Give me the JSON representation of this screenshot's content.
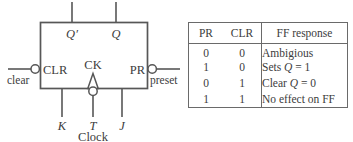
{
  "figure": {
    "block": {
      "inputs_top": [
        {
          "name": "q-not-output",
          "label": "Q′",
          "italic": true
        },
        {
          "name": "q-output",
          "label": "Q",
          "italic": true
        }
      ],
      "left_port": {
        "label": "CLR",
        "wire_label": "clear",
        "bubble": true
      },
      "right_port": {
        "label": "PR",
        "wire_label": "preset",
        "bubble": true
      },
      "clock_port": {
        "label": "CK",
        "bubble": true,
        "edge_triangle": true
      },
      "inputs_bottom": [
        {
          "name": "k-input",
          "label": "K",
          "italic": true
        },
        {
          "name": "t-input",
          "label": "T",
          "italic": true
        },
        {
          "name": "j-input",
          "label": "J",
          "italic": true
        }
      ],
      "clock_caption": "Clock"
    },
    "line_color": "#575757",
    "text_color": "#3c3c3c",
    "background": "#ffffff"
  },
  "table": {
    "headers": [
      "PR",
      "CLR",
      "FF response"
    ],
    "rows": [
      {
        "pr": "0",
        "clr": "0",
        "response": "Ambigious"
      },
      {
        "pr": "1",
        "clr": "0",
        "response_pre": "Sets ",
        "response_var": "Q",
        "response_post": " = 1"
      },
      {
        "pr": "0",
        "clr": "1",
        "response_pre": "Clear ",
        "response_var": "Q",
        "response_post": " = 0"
      },
      {
        "pr": "1",
        "clr": "1",
        "response": "No effect on FF"
      }
    ],
    "border_color": "#6a6a6a"
  }
}
